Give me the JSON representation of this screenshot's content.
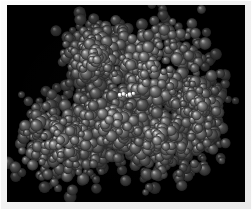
{
  "figure": {
    "kind": "molecular-rendering",
    "representation": "space-filling",
    "title": "",
    "caption": "",
    "colorscheme": "grayscale",
    "background_color": "#000000",
    "frame_color": "#f2f2f2",
    "canvas": {
      "x": 7,
      "y": 5,
      "width": 238,
      "height": 197
    },
    "image": {
      "width": 252,
      "height": 210
    }
  },
  "molecule": {
    "shape": "bilobal",
    "orientation": "upper-right to lower-left diagonal",
    "atom_count_estimate": 1400,
    "atom_radius_px": {
      "min": 3.2,
      "max": 6.4
    },
    "base_gray": "#9a9a9a",
    "highlight_gray": "#e6e6e6",
    "shadow_gray": "#1a1a1a",
    "lobes": [
      {
        "name": "upper-right-lobe",
        "cx": 150,
        "cy": 70,
        "rx": 62,
        "ry": 56,
        "density": 1.0
      },
      {
        "name": "lower-left-lobe",
        "cx": 62,
        "cy": 140,
        "rx": 46,
        "ry": 42,
        "density": 0.95
      },
      {
        "name": "central-bridge",
        "cx": 112,
        "cy": 122,
        "rx": 52,
        "ry": 40,
        "density": 0.9
      },
      {
        "name": "lower-right-lobe",
        "cx": 160,
        "cy": 140,
        "rx": 48,
        "ry": 38,
        "density": 0.88
      },
      {
        "name": "upper-left-arm",
        "cx": 95,
        "cy": 58,
        "rx": 32,
        "ry": 32,
        "density": 0.8
      },
      {
        "name": "right-tail",
        "cx": 198,
        "cy": 110,
        "rx": 26,
        "ry": 44,
        "density": 0.72
      }
    ],
    "ligand_site": {
      "label": "bright-highlight-cluster",
      "cx": 127,
      "cy": 95,
      "atom_count": 5,
      "color": "#f4f4f4"
    },
    "bounds_px": {
      "left": 18,
      "top": 12,
      "right": 228,
      "bottom": 192
    }
  }
}
